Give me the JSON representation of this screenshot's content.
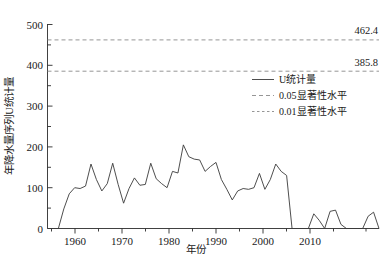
{
  "chart_data": {
    "type": "line",
    "title": "",
    "xlabel": "年份",
    "ylabel": "年降水量序列U统计量",
    "xlim": [
      1955,
      2016
    ],
    "ylim": [
      0,
      500
    ],
    "xticks": [
      1960,
      1970,
      1980,
      1990,
      2000,
      2010
    ],
    "xticklabels": [
      "1960",
      "1970",
      "1980",
      "1990",
      "2000",
      "2010"
    ],
    "yticks": [
      0,
      100,
      200,
      300,
      400,
      500
    ],
    "yticklabels": [
      "0",
      "100",
      "200",
      "300",
      "400",
      "500"
    ],
    "yminorticks": [
      50,
      150,
      250,
      350,
      450
    ],
    "grid": false,
    "legend_position": "upper-right-inside",
    "series": [
      {
        "name": "U统计量",
        "style": "solid",
        "color": "#3a3a3a",
        "x": [
          1955,
          1956,
          1957,
          1958,
          1959,
          1960,
          1961,
          1962,
          1963,
          1964,
          1965,
          1966,
          1967,
          1968,
          1969,
          1970,
          1971,
          1972,
          1973,
          1974,
          1975,
          1976,
          1977,
          1978,
          1979,
          1980,
          1981,
          1982,
          1983,
          1984,
          1985,
          1986,
          1987,
          1988,
          1989,
          1990,
          1991,
          1992,
          1993,
          1994,
          1995,
          1996,
          1997,
          1998,
          1999,
          2000,
          2001,
          2002,
          2003,
          2004,
          2005,
          2006,
          2007,
          2008,
          2009,
          2010,
          2011,
          2012,
          2013,
          2014,
          2015,
          2016
        ],
        "values": [
          0,
          0,
          0,
          48,
          85,
          100,
          98,
          104,
          158,
          120,
          92,
          110,
          160,
          108,
          62,
          98,
          124,
          106,
          108,
          160,
          122,
          110,
          100,
          140,
          136,
          205,
          176,
          170,
          168,
          140,
          152,
          162,
          120,
          96,
          70,
          92,
          98,
          96,
          100,
          135,
          96,
          120,
          158,
          140,
          130,
          0,
          0,
          0,
          0,
          36,
          20,
          0,
          42,
          45,
          10,
          0,
          0,
          0,
          0,
          30,
          40,
          0
        ]
      },
      {
        "name": "0.05显著性水平",
        "style": "dashed",
        "color": "#8a8a8a",
        "value": 385.8,
        "label": "385.8"
      },
      {
        "name": "0.01显著性水平",
        "style": "dashed-fine",
        "color": "#8a8a8a",
        "value": 462.4,
        "label": "462.4"
      }
    ],
    "annotations": [
      {
        "text": "462.4",
        "value": 462.4
      },
      {
        "text": "385.8",
        "value": 385.8
      }
    ]
  },
  "legend": {
    "entries": [
      {
        "label": "U统计量",
        "style": "solid"
      },
      {
        "label": "0.05显著性水平",
        "style": "dashed"
      },
      {
        "label": "0.01显著性水平",
        "style": "dashed-fine"
      }
    ]
  },
  "axes": {
    "x_title": "年份",
    "y_title": "年降水量序列U统计量"
  },
  "colors": {
    "series": "#3a3a3a",
    "threshold": "#8a8a8a",
    "axis": "#2b2b2b",
    "text": "#1a1a1a",
    "background": "#ffffff"
  }
}
